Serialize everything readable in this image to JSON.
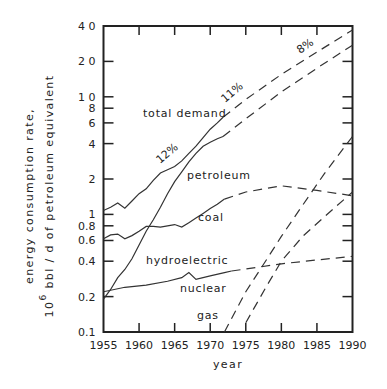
{
  "chart_data": {
    "type": "line",
    "title": "",
    "xlabel": "year",
    "ylabel_line1": "energy consumption rate,",
    "ylabel_line2_prefix": "10",
    "ylabel_line2_exponent": "6",
    "ylabel_line2_suffix": " bbl / d of petroleum equivalent",
    "xlim": [
      1955,
      1990
    ],
    "ylim": [
      0.1,
      40
    ],
    "yscale": "log",
    "grid": false,
    "legend": "none (inline labels)",
    "x_ticks": [
      1955,
      1960,
      1965,
      1970,
      1975,
      1980,
      1985,
      1990
    ],
    "x_tick_labels": [
      "1955",
      "1960",
      "1965",
      "1970",
      "1975",
      "1980",
      "1985",
      "1990"
    ],
    "y_ticks": [
      0.1,
      0.2,
      0.4,
      0.6,
      0.8,
      1,
      2,
      4,
      6,
      8,
      10,
      20,
      40
    ],
    "y_tick_labels": [
      "0.1",
      "0.2",
      "0.4",
      "0.6",
      "0.8",
      "1",
      "2",
      "4",
      "6",
      "8",
      "1 0",
      "2 0",
      "4 0"
    ],
    "series": [
      {
        "name": "total demand",
        "label": "total demand",
        "historical": [
          [
            1955,
            1.08
          ],
          [
            1956,
            1.15
          ],
          [
            1957,
            1.25
          ],
          [
            1958,
            1.13
          ],
          [
            1959,
            1.3
          ],
          [
            1960,
            1.5
          ],
          [
            1961,
            1.65
          ],
          [
            1962,
            1.95
          ],
          [
            1963,
            2.25
          ],
          [
            1964,
            2.4
          ],
          [
            1965,
            2.55
          ],
          [
            1966,
            2.85
          ],
          [
            1967,
            3.3
          ],
          [
            1968,
            3.8
          ],
          [
            1969,
            4.5
          ],
          [
            1970,
            5.3
          ],
          [
            1971,
            6.0
          ],
          [
            1971.8,
            6.7
          ]
        ],
        "projected": [
          [
            1971.8,
            6.7
          ],
          [
            1975,
            9.5
          ],
          [
            1980,
            15.5
          ],
          [
            1985,
            24.0
          ],
          [
            1990,
            37.0
          ]
        ]
      },
      {
        "name": "petroleum",
        "label": "petroleum",
        "historical": [
          [
            1955,
            0.19
          ],
          [
            1956,
            0.23
          ],
          [
            1957,
            0.29
          ],
          [
            1958,
            0.34
          ],
          [
            1959,
            0.42
          ],
          [
            1960,
            0.55
          ],
          [
            1961,
            0.72
          ],
          [
            1962,
            0.9
          ],
          [
            1963,
            1.15
          ],
          [
            1964,
            1.5
          ],
          [
            1965,
            1.9
          ],
          [
            1966,
            2.3
          ],
          [
            1967,
            2.8
          ],
          [
            1968,
            3.3
          ],
          [
            1969,
            3.8
          ],
          [
            1970,
            4.1
          ],
          [
            1971,
            4.4
          ],
          [
            1971.8,
            4.6
          ]
        ],
        "projected": [
          [
            1971.8,
            4.6
          ],
          [
            1975,
            6.5
          ],
          [
            1980,
            11.0
          ],
          [
            1985,
            17.5
          ],
          [
            1990,
            27.5
          ]
        ]
      },
      {
        "name": "coal",
        "label": "coal",
        "historical": [
          [
            1955,
            0.62
          ],
          [
            1956,
            0.67
          ],
          [
            1957,
            0.68
          ],
          [
            1958,
            0.62
          ],
          [
            1959,
            0.66
          ],
          [
            1960,
            0.72
          ],
          [
            1961,
            0.79
          ],
          [
            1962,
            0.79
          ],
          [
            1963,
            0.78
          ],
          [
            1964,
            0.8
          ],
          [
            1965,
            0.82
          ],
          [
            1966,
            0.78
          ],
          [
            1967,
            0.85
          ],
          [
            1968,
            0.93
          ],
          [
            1969,
            1.02
          ],
          [
            1970,
            1.12
          ],
          [
            1971,
            1.22
          ],
          [
            1972,
            1.35
          ]
        ],
        "projected": [
          [
            1972,
            1.35
          ],
          [
            1975,
            1.55
          ],
          [
            1980,
            1.75
          ],
          [
            1985,
            1.6
          ],
          [
            1990,
            1.44
          ]
        ]
      },
      {
        "name": "hydroelectric",
        "label": "hydroelectric",
        "historical": [
          [
            1955,
            0.22
          ],
          [
            1958,
            0.24
          ],
          [
            1961,
            0.25
          ],
          [
            1964,
            0.27
          ],
          [
            1966,
            0.29
          ],
          [
            1967,
            0.32
          ],
          [
            1968,
            0.28
          ],
          [
            1970,
            0.3
          ],
          [
            1972,
            0.32
          ],
          [
            1973,
            0.33
          ]
        ],
        "projected": [
          [
            1973,
            0.33
          ],
          [
            1980,
            0.38
          ],
          [
            1985,
            0.41
          ],
          [
            1990,
            0.44
          ]
        ]
      },
      {
        "name": "nuclear",
        "label": "nuclear",
        "historical": [],
        "projected": [
          [
            1975,
            0.12
          ],
          [
            1978,
            0.25
          ],
          [
            1980,
            0.4
          ],
          [
            1983,
            0.65
          ],
          [
            1986,
            0.95
          ],
          [
            1990,
            1.55
          ]
        ]
      },
      {
        "name": "gas",
        "label": "gas",
        "historical": [],
        "projected": [
          [
            1972,
            0.1
          ],
          [
            1975,
            0.22
          ],
          [
            1978,
            0.42
          ],
          [
            1980,
            0.65
          ],
          [
            1983,
            1.2
          ],
          [
            1986,
            2.2
          ],
          [
            1990,
            4.6
          ]
        ]
      }
    ],
    "annotations": [
      {
        "text": "12%",
        "near": "total demand",
        "year": 1962
      },
      {
        "text": "11%",
        "near": "total demand",
        "year": 1973
      },
      {
        "text": "8%",
        "near": "total demand",
        "year": 1983
      }
    ]
  }
}
